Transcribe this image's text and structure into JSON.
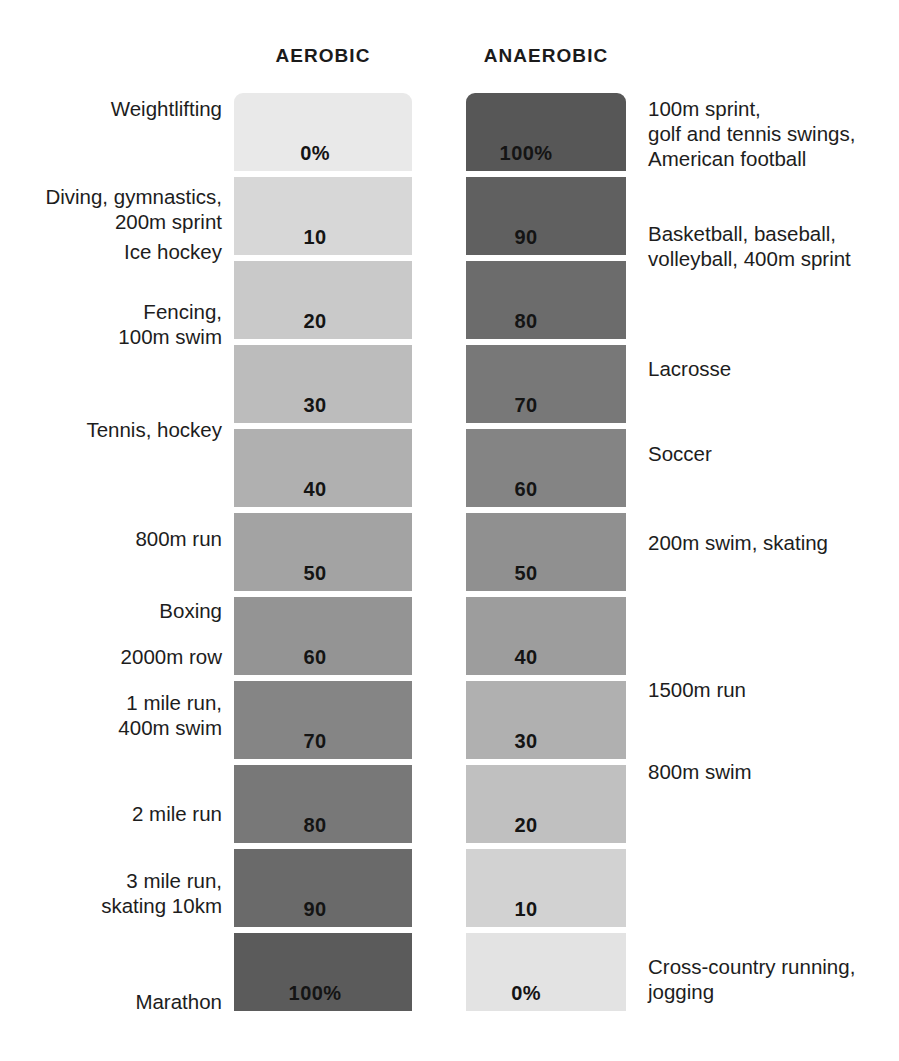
{
  "headers": {
    "left": "AEROBIC",
    "right": "ANAEROBIC"
  },
  "colors": {
    "aerobic_min": "#e9e9e9",
    "aerobic_max": "#575757",
    "anaerobic_min": "#e9e9e9",
    "anaerobic_max": "#575757",
    "text": "#1d1d1d",
    "background": "#ffffff"
  },
  "chart_data": {
    "type": "bar",
    "title": "",
    "subtitle": "",
    "xlabel": "",
    "ylabel": "",
    "grid": false,
    "legend_position": "top",
    "categories": [
      "row-0",
      "row-1",
      "row-2",
      "row-3",
      "row-4",
      "row-5",
      "row-6",
      "row-7",
      "row-8",
      "row-9",
      "row-10"
    ],
    "series": [
      {
        "name": "AEROBIC",
        "values": [
          0,
          10,
          20,
          30,
          40,
          50,
          60,
          70,
          80,
          90,
          100
        ]
      },
      {
        "name": "ANAEROBIC",
        "values": [
          100,
          90,
          80,
          70,
          60,
          50,
          40,
          30,
          20,
          10,
          0
        ]
      }
    ],
    "aerobic_labels": [
      "0%",
      "10",
      "20",
      "30",
      "40",
      "50",
      "60",
      "70",
      "80",
      "90",
      "100%"
    ],
    "anaerobic_labels": [
      "100%",
      "90",
      "80",
      "70",
      "60",
      "50",
      "40",
      "30",
      "20",
      "10",
      "0%"
    ],
    "ylim": [
      0,
      100
    ]
  },
  "rows": [
    {
      "aerobic_value": "0%",
      "anaerobic_value": "100%",
      "left_label": "Weightlifting",
      "right_label": "100m sprint,\ngolf and tennis swings,\nAmerican football",
      "aerobic_color": "#e9e9e9",
      "anaerobic_color": "#575757"
    },
    {
      "aerobic_value": "10",
      "anaerobic_value": "90",
      "left_label": "Diving, gymnastics,\n200m sprint",
      "right_label": "Basketball, baseball,\nvolleyball, 400m sprint",
      "aerobic_color": "#d7d7d7",
      "anaerobic_color": "#606060"
    },
    {
      "aerobic_value": "20",
      "anaerobic_value": "80",
      "left_label": "Fencing,\n100m swim",
      "right_label": "",
      "aerobic_color": "#c9c9c9",
      "anaerobic_color": "#6c6c6c"
    },
    {
      "aerobic_value": "30",
      "anaerobic_value": "70",
      "left_label": "Tennis, hockey",
      "right_label": "Lacrosse",
      "aerobic_color": "#bcbcbc",
      "anaerobic_color": "#787878"
    },
    {
      "aerobic_value": "40",
      "anaerobic_value": "60",
      "left_label": "",
      "right_label": "Soccer",
      "aerobic_color": "#b0b0b0",
      "anaerobic_color": "#848484"
    },
    {
      "aerobic_value": "50",
      "anaerobic_value": "50",
      "left_label": "800m run",
      "right_label": "200m swim, skating",
      "aerobic_color": "#a3a3a3",
      "anaerobic_color": "#909090"
    },
    {
      "aerobic_value": "60",
      "anaerobic_value": "40",
      "left_label": "2000m row",
      "right_label": "",
      "aerobic_color": "#949494",
      "anaerobic_color": "#9d9d9d"
    },
    {
      "aerobic_value": "70",
      "anaerobic_value": "30",
      "left_label": "1 mile run,\n400m swim",
      "right_label": "1500m run",
      "aerobic_color": "#858585",
      "anaerobic_color": "#b0b0b0"
    },
    {
      "aerobic_value": "80",
      "anaerobic_value": "20",
      "left_label": "2 mile run",
      "right_label": "800m swim",
      "aerobic_color": "#787878",
      "anaerobic_color": "#c0c0c0"
    },
    {
      "aerobic_value": "90",
      "anaerobic_value": "10",
      "left_label": "3 mile run,\nskating 10km",
      "right_label": "",
      "aerobic_color": "#6a6a6a",
      "anaerobic_color": "#d2d2d2"
    },
    {
      "aerobic_value": "100%",
      "anaerobic_value": "0%",
      "left_label": "Marathon",
      "right_label": "Cross-country running,\njogging",
      "aerobic_color": "#5b5b5b",
      "anaerobic_color": "#e3e3e3"
    }
  ],
  "extra_left_labels": [
    {
      "text": "Ice hockey",
      "after_row": 1
    },
    {
      "text": "Boxing",
      "after_row": 5
    }
  ],
  "layout": {
    "bar_top": 93,
    "bar_height": 78,
    "row_pitch": 84
  }
}
